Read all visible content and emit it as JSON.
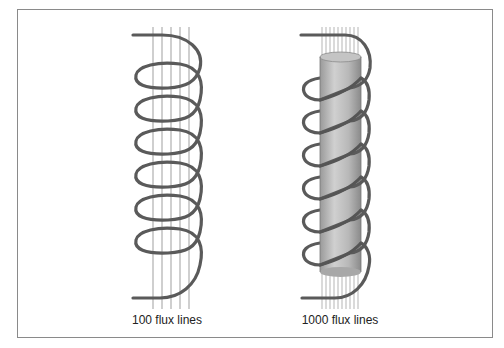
{
  "figure": {
    "panels": [
      {
        "id": "air-core",
        "label": "100 flux lines",
        "core": "none",
        "flux_line_count_drawn": 5,
        "coil_turns": 6
      },
      {
        "id": "iron-core",
        "label": "1000 flux lines",
        "core": "cylinder",
        "flux_line_count_drawn": 10,
        "coil_turns": 6
      }
    ],
    "colors": {
      "frame": "#8a8a8a",
      "coil": "#555555",
      "flux": "#b5b5b5",
      "core_light": "#d4d4d4",
      "core_dark": "#8f8f8f"
    }
  }
}
